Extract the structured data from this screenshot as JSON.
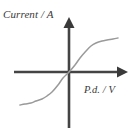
{
  "figure": {
    "kind": "line-graph",
    "background_color": "#ffffff",
    "axis_color": "#444444",
    "curve_color": "#9a9a9a"
  },
  "labels": {
    "y_axis": "Current / A",
    "x_axis": "P.d. / V"
  },
  "chart_data": {
    "type": "line",
    "title": "",
    "xlabel": "P.d. / V",
    "ylabel": "Current / A",
    "grid": false,
    "legend": null,
    "axes": {
      "origin_px": [
        69,
        72
      ],
      "x_axis_from_px": [
        14,
        72
      ],
      "x_axis_to_px": [
        128,
        72
      ],
      "y_axis_from_px": [
        69,
        128
      ],
      "y_axis_to_px": [
        69,
        17
      ],
      "x_arrow": "right",
      "y_arrow": "up",
      "ticks": [],
      "xlim": [
        -1,
        1
      ],
      "ylim": [
        -1,
        1
      ]
    },
    "annotations": [],
    "series": [
      {
        "name": "I-V characteristic",
        "x": [
          -0.88,
          -0.78,
          -0.68,
          -0.58,
          -0.48,
          -0.38,
          -0.28,
          -0.18,
          -0.09,
          0.0,
          0.09,
          0.18,
          0.28,
          0.38,
          0.48,
          0.58,
          0.68,
          0.78,
          0.88
        ],
        "y": [
          -0.62,
          -0.61,
          -0.59,
          -0.57,
          -0.54,
          -0.49,
          -0.42,
          -0.29,
          -0.15,
          0.0,
          0.15,
          0.29,
          0.42,
          0.49,
          0.54,
          0.57,
          0.59,
          0.61,
          0.62
        ],
        "points_px": [
          [
            20,
            105
          ],
          [
            25,
            104
          ],
          [
            31,
            103
          ],
          [
            36,
            101
          ],
          [
            42,
            99
          ],
          [
            47,
            96
          ],
          [
            52,
            92
          ],
          [
            58,
            85
          ],
          [
            63,
            78
          ],
          [
            69,
            72
          ],
          [
            75,
            65
          ],
          [
            80,
            58
          ],
          [
            86,
            51
          ],
          [
            91,
            46
          ],
          [
            96,
            43
          ],
          [
            102,
            41
          ],
          [
            107,
            40
          ],
          [
            113,
            39
          ],
          [
            118,
            38
          ]
        ]
      }
    ]
  }
}
